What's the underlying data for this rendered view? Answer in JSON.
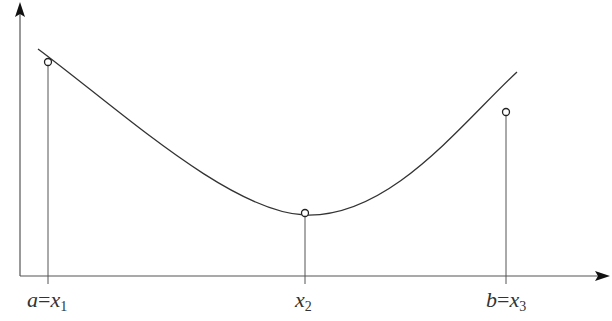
{
  "diagram": {
    "type": "golden-section / three-point interval on a unimodal curve",
    "axes": {
      "x_axis": true,
      "y_axis": true,
      "arrowheads": true
    },
    "points": [
      {
        "id": "x1",
        "var": "a",
        "eq": "=",
        "sym": "x",
        "sub": "1"
      },
      {
        "id": "x2",
        "sym": "x",
        "sub": "2"
      },
      {
        "id": "x3",
        "var": "b",
        "eq": "=",
        "sym": "x",
        "sub": "3"
      }
    ],
    "colors": {
      "line": "#333333",
      "background": "#ffffff"
    }
  }
}
